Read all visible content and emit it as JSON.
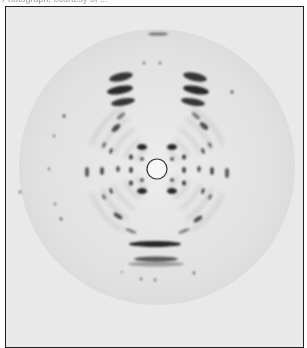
{
  "caption": {
    "text": "Photograph, courtesy of ..."
  },
  "image": {
    "description": "X-ray fiber diffraction pattern",
    "frame_color": "#222222",
    "background_color": "#e9e9e9",
    "disc_color": "#e0e0e0",
    "spot_color": "#1a1a1a",
    "center": [
      156,
      166
    ],
    "disc_radius": 138,
    "beam_stop_radius": 10
  },
  "spots": [
    {
      "cx": 157,
      "cy": 33,
      "rx": 10,
      "ry": 1.6,
      "o": 0.55
    },
    {
      "cx": 120,
      "cy": 76,
      "rx": 12,
      "ry": 4,
      "o": 0.85,
      "rot": -12
    },
    {
      "cx": 194,
      "cy": 76,
      "rx": 12,
      "ry": 4,
      "o": 0.85,
      "rot": 12
    },
    {
      "cx": 119,
      "cy": 89,
      "rx": 13,
      "ry": 4,
      "o": 0.9,
      "rot": -10
    },
    {
      "cx": 195,
      "cy": 89,
      "rx": 13,
      "ry": 4,
      "o": 0.9,
      "rot": 10
    },
    {
      "cx": 122,
      "cy": 101,
      "rx": 12,
      "ry": 3.5,
      "o": 0.85,
      "rot": -10
    },
    {
      "cx": 192,
      "cy": 101,
      "rx": 12,
      "ry": 3.5,
      "o": 0.85,
      "rot": 10
    },
    {
      "cx": 120,
      "cy": 115,
      "rx": 5,
      "ry": 2,
      "o": 0.5,
      "rot": -40
    },
    {
      "cx": 195,
      "cy": 115,
      "rx": 5,
      "ry": 2,
      "o": 0.5,
      "rot": 40
    },
    {
      "cx": 115,
      "cy": 127,
      "rx": 5,
      "ry": 2.5,
      "o": 0.75,
      "rot": -40
    },
    {
      "cx": 203,
      "cy": 125,
      "rx": 5,
      "ry": 2.5,
      "o": 0.75,
      "rot": 40
    },
    {
      "cx": 141,
      "cy": 146,
      "rx": 5,
      "ry": 3,
      "o": 0.95
    },
    {
      "cx": 171,
      "cy": 146,
      "rx": 5,
      "ry": 3,
      "o": 0.95
    },
    {
      "cx": 141,
      "cy": 190,
      "rx": 5,
      "ry": 3,
      "o": 0.95
    },
    {
      "cx": 171,
      "cy": 190,
      "rx": 5,
      "ry": 3,
      "o": 0.95
    },
    {
      "cx": 141,
      "cy": 158,
      "rx": 1.8,
      "ry": 1.8,
      "o": 0.85
    },
    {
      "cx": 171,
      "cy": 158,
      "rx": 1.8,
      "ry": 1.8,
      "o": 0.85
    },
    {
      "cx": 141,
      "cy": 179,
      "rx": 1.8,
      "ry": 1.8,
      "o": 0.85
    },
    {
      "cx": 171,
      "cy": 179,
      "rx": 1.8,
      "ry": 1.8,
      "o": 0.85
    },
    {
      "cx": 130,
      "cy": 156,
      "rx": 2,
      "ry": 2.5,
      "o": 0.85
    },
    {
      "cx": 183,
      "cy": 156,
      "rx": 2,
      "ry": 2.5,
      "o": 0.85
    },
    {
      "cx": 130,
      "cy": 169,
      "rx": 1.8,
      "ry": 3,
      "o": 0.85
    },
    {
      "cx": 183,
      "cy": 169,
      "rx": 1.8,
      "ry": 3,
      "o": 0.85
    },
    {
      "cx": 130,
      "cy": 182,
      "rx": 2,
      "ry": 2.5,
      "o": 0.85
    },
    {
      "cx": 183,
      "cy": 182,
      "rx": 2,
      "ry": 2.5,
      "o": 0.85
    },
    {
      "cx": 117,
      "cy": 168,
      "rx": 1.6,
      "ry": 3,
      "o": 0.8
    },
    {
      "cx": 198,
      "cy": 168,
      "rx": 1.6,
      "ry": 3,
      "o": 0.8
    },
    {
      "cx": 110,
      "cy": 150,
      "rx": 1.5,
      "ry": 3,
      "o": 0.75,
      "rot": 20
    },
    {
      "cx": 202,
      "cy": 150,
      "rx": 1.5,
      "ry": 3,
      "o": 0.75,
      "rot": -20
    },
    {
      "cx": 110,
      "cy": 190,
      "rx": 1.5,
      "ry": 3,
      "o": 0.75,
      "rot": -20
    },
    {
      "cx": 202,
      "cy": 190,
      "rx": 1.5,
      "ry": 3,
      "o": 0.75,
      "rot": 20
    },
    {
      "cx": 103,
      "cy": 144,
      "rx": 1.5,
      "ry": 3,
      "o": 0.6,
      "rot": 30
    },
    {
      "cx": 209,
      "cy": 144,
      "rx": 1.5,
      "ry": 3,
      "o": 0.6,
      "rot": -30
    },
    {
      "cx": 103,
      "cy": 196,
      "rx": 1.5,
      "ry": 3,
      "o": 0.6,
      "rot": -30
    },
    {
      "cx": 209,
      "cy": 196,
      "rx": 1.5,
      "ry": 3,
      "o": 0.6,
      "rot": 30
    },
    {
      "cx": 101,
      "cy": 170,
      "rx": 1.8,
      "ry": 4,
      "o": 0.8
    },
    {
      "cx": 211,
      "cy": 170,
      "rx": 1.8,
      "ry": 4,
      "o": 0.8
    },
    {
      "cx": 86,
      "cy": 171,
      "rx": 2,
      "ry": 5,
      "o": 0.7
    },
    {
      "cx": 226,
      "cy": 172,
      "rx": 2,
      "ry": 5,
      "o": 0.7
    },
    {
      "cx": 117,
      "cy": 215,
      "rx": 5,
      "ry": 2,
      "o": 0.75,
      "rot": 35
    },
    {
      "cx": 197,
      "cy": 218,
      "rx": 5,
      "ry": 2,
      "o": 0.75,
      "rot": -35
    },
    {
      "cx": 130,
      "cy": 230,
      "rx": 6,
      "ry": 1.5,
      "o": 0.5,
      "rot": 20
    },
    {
      "cx": 183,
      "cy": 230,
      "rx": 6,
      "ry": 1.5,
      "o": 0.5,
      "rot": -20
    },
    {
      "cx": 154,
      "cy": 243,
      "rx": 26,
      "ry": 3,
      "o": 0.95
    },
    {
      "cx": 155,
      "cy": 258,
      "rx": 22,
      "ry": 2.5,
      "o": 0.7
    },
    {
      "cx": 155,
      "cy": 263,
      "rx": 28,
      "ry": 2.5,
      "o": 0.35
    },
    {
      "cx": 63,
      "cy": 115,
      "rx": 1.5,
      "ry": 1.5,
      "o": 0.8
    },
    {
      "cx": 53,
      "cy": 135,
      "rx": 1.2,
      "ry": 1.2,
      "o": 0.6
    },
    {
      "cx": 48,
      "cy": 168,
      "rx": 1.2,
      "ry": 1.2,
      "o": 0.6
    },
    {
      "cx": 19,
      "cy": 191,
      "rx": 1.3,
      "ry": 1.3,
      "o": 0.7
    },
    {
      "cx": 54,
      "cy": 203,
      "rx": 1.2,
      "ry": 1.2,
      "o": 0.6
    },
    {
      "cx": 60,
      "cy": 218,
      "rx": 1.4,
      "ry": 1.4,
      "o": 0.7
    },
    {
      "cx": 231,
      "cy": 91,
      "rx": 1.4,
      "ry": 1.4,
      "o": 0.8
    },
    {
      "cx": 143,
      "cy": 62,
      "rx": 1.2,
      "ry": 1.2,
      "o": 0.7
    },
    {
      "cx": 159,
      "cy": 62,
      "rx": 1.2,
      "ry": 1.2,
      "o": 0.7
    },
    {
      "cx": 140,
      "cy": 278,
      "rx": 1.2,
      "ry": 1.2,
      "o": 0.7
    },
    {
      "cx": 154,
      "cy": 279,
      "rx": 1.2,
      "ry": 1.2,
      "o": 0.7
    },
    {
      "cx": 193,
      "cy": 272,
      "rx": 1.3,
      "ry": 1.3,
      "o": 0.7
    },
    {
      "cx": 121,
      "cy": 271,
      "rx": 1,
      "ry": 1,
      "o": 0.5
    }
  ]
}
